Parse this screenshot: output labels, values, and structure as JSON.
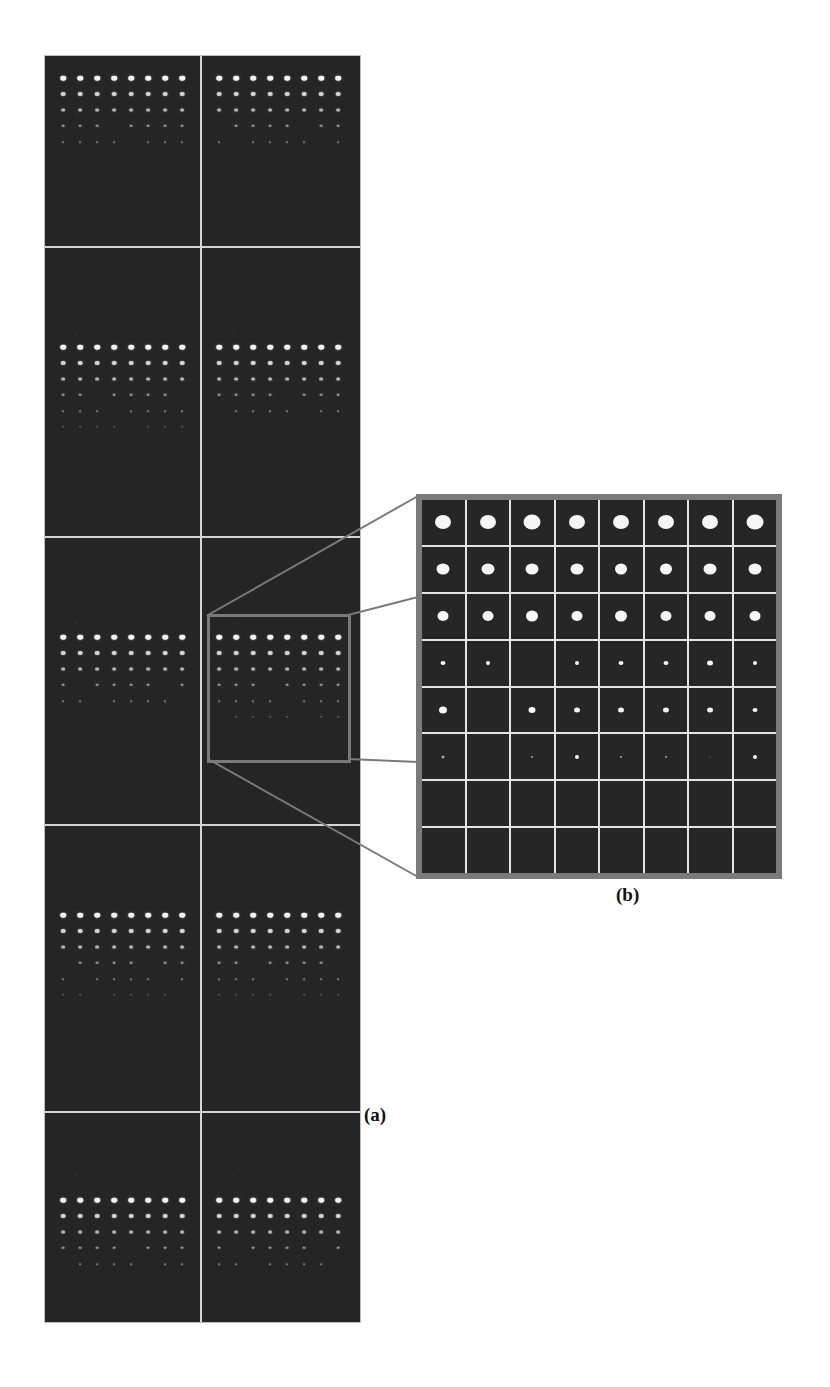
{
  "figure": {
    "panel_a_label": "(a)",
    "panel_b_label": "(b)",
    "colors": {
      "background": "#ffffff",
      "image_background": "#262626",
      "grid_line": "#d6d6d6",
      "zoom_box": "#7a7a7a",
      "spot": "#f4f4f4"
    },
    "panel_a": {
      "columns": 2,
      "rows": 5,
      "description": "Montage of 10 fluorescence microarray images, each showing an 8-column grid of bright spots whose intensity decreases row by row",
      "spot_rows_visible_per_cell": [
        5,
        5,
        6,
        5,
        5,
        6,
        6,
        6,
        5,
        5
      ]
    },
    "panel_b": {
      "grid_columns": 8,
      "grid_rows": 8,
      "description": "Enlarged view of the highlighted region from panel (a), divided into an 8x8 grid of cells",
      "spot_sizes": [
        [
          16,
          16,
          17,
          16,
          16,
          16,
          16,
          17
        ],
        [
          13,
          13,
          13,
          13,
          12,
          12,
          13,
          13
        ],
        [
          11,
          11,
          12,
          11,
          12,
          11,
          11,
          11
        ],
        [
          5,
          4,
          0,
          4,
          5,
          5,
          6,
          4
        ],
        [
          8,
          0,
          7,
          6,
          6,
          6,
          6,
          5
        ],
        [
          3,
          0,
          2,
          4,
          2,
          2,
          1,
          4
        ],
        [
          0,
          0,
          0,
          0,
          0,
          0,
          0,
          0
        ],
        [
          0,
          0,
          0,
          0,
          0,
          0,
          0,
          0
        ]
      ]
    }
  }
}
